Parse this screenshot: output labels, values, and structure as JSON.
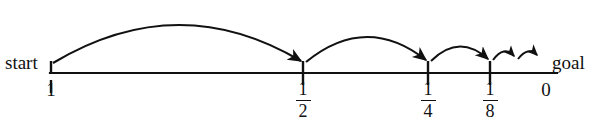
{
  "figure": {
    "background_color": "#ffffff",
    "ink_color": "#111111"
  },
  "axis": {
    "x_start": 50,
    "x_end": 557,
    "y": 73,
    "stroke_width": 2.2
  },
  "endpoints": {
    "start_label": "start",
    "goal_label": "goal"
  },
  "ticks": [
    {
      "name": "tick-1",
      "label_type": "integer",
      "label": "1",
      "x": 50,
      "top": 62,
      "bottom": 73,
      "below_tick": true
    },
    {
      "name": "tick-one-half",
      "label_type": "fraction",
      "numerator": "1",
      "denominator": "2",
      "x": 303,
      "top": 62,
      "bottom": 84
    },
    {
      "name": "tick-one-quarter",
      "label_type": "fraction",
      "numerator": "1",
      "denominator": "4",
      "x": 428,
      "top": 62,
      "bottom": 84
    },
    {
      "name": "tick-one-eighth",
      "label_type": "fraction",
      "numerator": "1",
      "denominator": "8",
      "x": 490,
      "top": 62,
      "bottom": 84
    },
    {
      "name": "tick-zero",
      "label_type": "integer",
      "label": "0",
      "x": 546,
      "top": 73,
      "bottom": 73
    }
  ],
  "arcs": [
    {
      "name": "arc-1-to-one-half",
      "from_x": 52,
      "to_x": 303,
      "apex_y": 14,
      "base_y": 64
    },
    {
      "name": "arc-one-half-to-quarter",
      "from_x": 305,
      "to_x": 428,
      "apex_y": 32,
      "base_y": 64
    },
    {
      "name": "arc-quarter-to-eighth",
      "from_x": 430,
      "to_x": 490,
      "apex_y": 45,
      "base_y": 64
    },
    {
      "name": "arc-eighth-to-sixteenth",
      "from_x": 492,
      "to_x": 516,
      "apex_y": 51,
      "base_y": 62
    },
    {
      "name": "arc-sixteenth-to-next",
      "from_x": 518,
      "to_x": 538,
      "apex_y": 53,
      "base_y": 62
    }
  ]
}
